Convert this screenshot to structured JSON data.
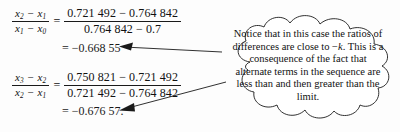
{
  "figure": {
    "type": "math-annotation-figure",
    "background_color": "#fdfdfd",
    "ink_color": "#111111"
  },
  "equations": [
    {
      "id": "eq1",
      "lhs": {
        "numerator": "x₂ − x₁",
        "denominator": "x₁ − x₀",
        "num_var": "x",
        "num_sub_a": "2",
        "num_sub_b": "1",
        "den_var": "x",
        "den_sub_a": "1",
        "den_sub_b": "0"
      },
      "equals": "=",
      "rhs": {
        "numerator": "0.721 492 − 0.764 842",
        "denominator": "0.764 842 − 0.7"
      },
      "result": "= −0.668 55"
    },
    {
      "id": "eq2",
      "lhs": {
        "numerator": "x₃ − x₂",
        "denominator": "x₂ − x₁",
        "num_var": "x",
        "num_sub_a": "3",
        "num_sub_b": "2",
        "den_var": "x",
        "den_sub_a": "2",
        "den_sub_b": "1"
      },
      "equals": "=",
      "rhs": {
        "numerator": "0.750 821 − 0.721 492",
        "denominator": "0.721 492 − 0.764 842"
      },
      "result": "= −0.676 57."
    }
  ],
  "callout": {
    "shape": "thought-cloud",
    "line1": "Notice that in this case",
    "line2": "the ratios of differences are close",
    "line3_before_k": "to −",
    "line3_k": "k",
    "line3_after_k": ". This is a consequence of the",
    "line4": "fact that alternate terms in the",
    "line5": "sequence are less than and then",
    "line6": "greater than the limit."
  },
  "arrows": [
    {
      "name": "arrow-to-result-1",
      "direction": "points-left",
      "from": "callout",
      "to": "result of first ratio"
    },
    {
      "name": "arrow-to-result-2",
      "direction": "points-down-left",
      "from": "callout",
      "to": "result of second ratio"
    }
  ]
}
